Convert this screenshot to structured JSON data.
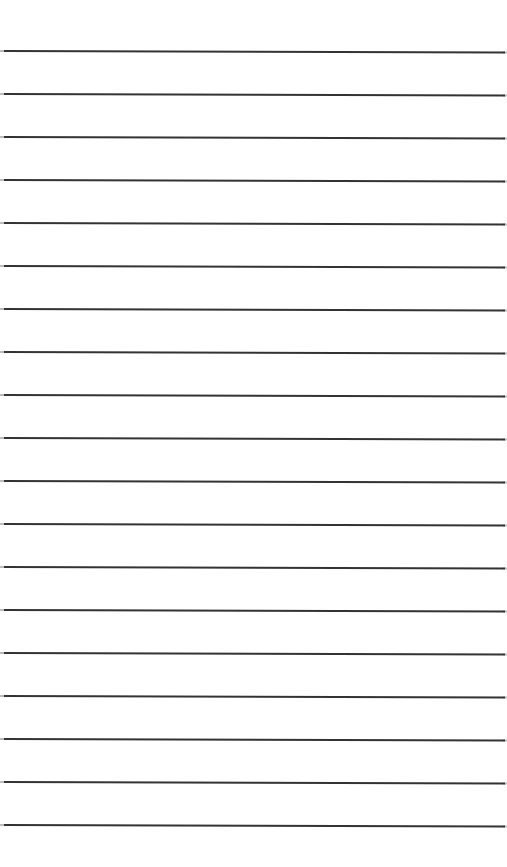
{
  "page": {
    "background": "#ffffff",
    "width": 507,
    "height": 867
  },
  "ruled_lines": {
    "color": "#333333",
    "end_fade_color": "#bbbbbb",
    "thickness": 2,
    "x_start": 4,
    "x_end": 505,
    "slope_px": 1.5,
    "count": 19,
    "y_positions": [
      51,
      94,
      137,
      180,
      223,
      266,
      309,
      352,
      395,
      438,
      481,
      524,
      567,
      610,
      653,
      696,
      739,
      782,
      825
    ]
  }
}
